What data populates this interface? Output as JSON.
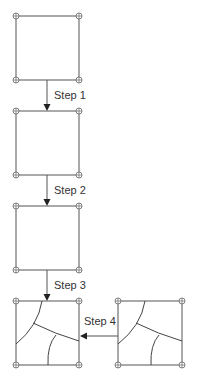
{
  "diagram": {
    "steps": [
      {
        "label": "Step 1"
      },
      {
        "label": "Step 2"
      },
      {
        "label": "Step 3"
      },
      {
        "label": "Step 4"
      }
    ],
    "colors": {
      "edge": "#555555",
      "text": "#333333",
      "arrowhead": "#222222",
      "background": "#ffffff"
    }
  }
}
